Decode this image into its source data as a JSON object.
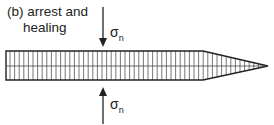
{
  "figure": {
    "panel_label": "(b)",
    "title_line1": "arrest and",
    "title_line2": "healing",
    "stress_symbol": "σ",
    "stress_subscript": "n",
    "colors": {
      "line": "#222222",
      "hatch": "#555555",
      "background": "#ffffff"
    }
  }
}
